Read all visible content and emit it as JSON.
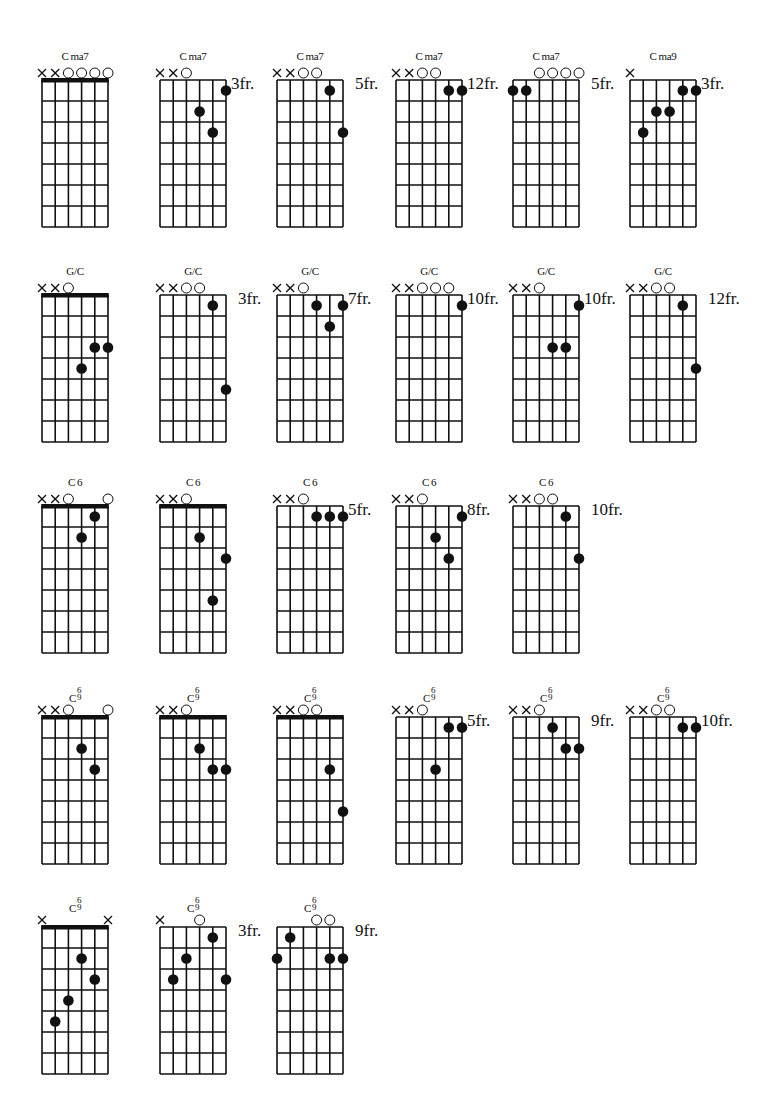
{
  "page": {
    "background": "#ffffff",
    "ink": "#111111",
    "layout": {
      "col_x": [
        42,
        160,
        277,
        396,
        513,
        630
      ],
      "row_grid_top": [
        80,
        295,
        506,
        717,
        927
      ],
      "cell_w": 13.2,
      "cell_h": 21,
      "strings": 6,
      "frets": 7
    }
  },
  "chart_data": {
    "type": "table",
    "notation": {
      "strings": "1 = low E (left) ... 6 = high e (right)",
      "markers": "x = muted, o = open, '' = none",
      "dots": "[string, fret-cell] relative to diagram top",
      "nut": "true when thick top bar (open position)"
    },
    "rows": [
      {
        "name": "Cma7",
        "chords": [
          {
            "title": "Cma7",
            "title_main": "C",
            "title_suffix": "ma7",
            "row": 0,
            "col": 0,
            "nut": true,
            "fret_label": "",
            "markers": [
              "x",
              "x",
              "o",
              "o",
              "o",
              "o"
            ],
            "dots": []
          },
          {
            "title": "Cma7",
            "title_main": "C",
            "title_suffix": "ma7",
            "row": 0,
            "col": 1,
            "nut": false,
            "fret_label": "3fr.",
            "markers": [
              "x",
              "x",
              "o",
              "",
              "",
              ""
            ],
            "dots": [
              [
                6,
                1
              ],
              [
                4,
                2
              ],
              [
                5,
                3
              ]
            ]
          },
          {
            "title": "Cma7",
            "title_main": "C",
            "title_suffix": "ma7",
            "row": 0,
            "col": 2,
            "nut": false,
            "fret_label": "5fr.",
            "markers": [
              "x",
              "x",
              "o",
              "o",
              "",
              ""
            ],
            "dots": [
              [
                5,
                1
              ],
              [
                6,
                3
              ]
            ]
          },
          {
            "title": "Cma7",
            "title_main": "C",
            "title_suffix": "ma7",
            "row": 0,
            "col": 3,
            "nut": false,
            "fret_label": "12fr.",
            "markers": [
              "x",
              "x",
              "o",
              "o",
              "",
              ""
            ],
            "dots": [
              [
                5,
                1
              ],
              [
                6,
                1
              ]
            ]
          },
          {
            "title": "Cma7",
            "title_main": "C",
            "title_suffix": "ma7",
            "row": 0,
            "col": 4,
            "nut": false,
            "fret_label": "5fr.",
            "markers": [
              "",
              "",
              "o",
              "o",
              "o",
              "o"
            ],
            "dots": [
              [
                1,
                1
              ],
              [
                2,
                1
              ]
            ]
          },
          {
            "title": "Cma9",
            "title_main": "C",
            "title_suffix": "ma9",
            "row": 0,
            "col": 5,
            "nut": false,
            "fret_label": "3fr.",
            "markers": [
              "x",
              "",
              "",
              "",
              "",
              ""
            ],
            "dots": [
              [
                5,
                1
              ],
              [
                6,
                1
              ],
              [
                3,
                2
              ],
              [
                4,
                2
              ],
              [
                2,
                3
              ]
            ]
          }
        ]
      },
      {
        "name": "G/C",
        "chords": [
          {
            "title": "G/C",
            "title_main": "G/C",
            "title_suffix": "",
            "row": 1,
            "col": 0,
            "nut": true,
            "fret_label": "",
            "markers": [
              "x",
              "x",
              "o",
              "",
              "",
              ""
            ],
            "dots": [
              [
                5,
                3
              ],
              [
                6,
                3
              ],
              [
                4,
                4
              ]
            ]
          },
          {
            "title": "G/C",
            "title_main": "G/C",
            "title_suffix": "",
            "row": 1,
            "col": 1,
            "nut": false,
            "fret_label": "3fr.",
            "markers": [
              "x",
              "x",
              "o",
              "o",
              "",
              ""
            ],
            "dots": [
              [
                5,
                1
              ],
              [
                6,
                5
              ]
            ]
          },
          {
            "title": "G/C",
            "title_main": "G/C",
            "title_suffix": "",
            "row": 1,
            "col": 2,
            "nut": false,
            "fret_label": "7fr.",
            "markers": [
              "x",
              "x",
              "o",
              "",
              "",
              ""
            ],
            "dots": [
              [
                4,
                1
              ],
              [
                6,
                1
              ],
              [
                5,
                2
              ]
            ]
          },
          {
            "title": "G/C",
            "title_main": "G/C",
            "title_suffix": "",
            "row": 1,
            "col": 3,
            "nut": false,
            "fret_label": "10fr.",
            "markers": [
              "x",
              "x",
              "o",
              "o",
              "o",
              ""
            ],
            "dots": [
              [
                6,
                1
              ]
            ]
          },
          {
            "title": "G/C",
            "title_main": "G/C",
            "title_suffix": "",
            "row": 1,
            "col": 4,
            "nut": false,
            "fret_label": "10fr.",
            "markers": [
              "x",
              "x",
              "o",
              "",
              "",
              ""
            ],
            "dots": [
              [
                6,
                1
              ],
              [
                4,
                3
              ],
              [
                5,
                3
              ]
            ]
          },
          {
            "title": "G/C",
            "title_main": "G/C",
            "title_suffix": "",
            "row": 1,
            "col": 5,
            "nut": false,
            "fret_label": "12fr.",
            "markers": [
              "x",
              "x",
              "o",
              "o",
              "",
              ""
            ],
            "dots": [
              [
                5,
                1
              ],
              [
                6,
                4
              ]
            ]
          }
        ]
      },
      {
        "name": "C6",
        "chords": [
          {
            "title": "C6",
            "title_main": "C",
            "title_suffix": "6",
            "row": 2,
            "col": 0,
            "nut": true,
            "fret_label": "",
            "markers": [
              "x",
              "x",
              "o",
              "",
              "",
              "o"
            ],
            "dots": [
              [
                5,
                1
              ],
              [
                4,
                2
              ]
            ]
          },
          {
            "title": "C6",
            "title_main": "C",
            "title_suffix": "6",
            "row": 2,
            "col": 1,
            "nut": true,
            "fret_label": "",
            "markers": [
              "x",
              "x",
              "o",
              "",
              "",
              ""
            ],
            "dots": [
              [
                4,
                2
              ],
              [
                6,
                3
              ],
              [
                5,
                5
              ]
            ]
          },
          {
            "title": "C6",
            "title_main": "C",
            "title_suffix": "6",
            "row": 2,
            "col": 2,
            "nut": false,
            "fret_label": "5fr.",
            "markers": [
              "x",
              "x",
              "o",
              "",
              "",
              ""
            ],
            "dots": [
              [
                4,
                1
              ],
              [
                5,
                1
              ],
              [
                6,
                1
              ]
            ]
          },
          {
            "title": "C6",
            "title_main": "C",
            "title_suffix": "6",
            "row": 2,
            "col": 3,
            "nut": false,
            "fret_label": "8fr.",
            "markers": [
              "x",
              "x",
              "o",
              "",
              "",
              ""
            ],
            "dots": [
              [
                6,
                1
              ],
              [
                4,
                2
              ],
              [
                5,
                3
              ]
            ]
          },
          {
            "title": "C6",
            "title_main": "C",
            "title_suffix": "6",
            "row": 2,
            "col": 4,
            "nut": false,
            "fret_label": "10fr.",
            "markers": [
              "x",
              "x",
              "o",
              "o",
              "",
              ""
            ],
            "dots": [
              [
                5,
                1
              ],
              [
                6,
                3
              ]
            ]
          }
        ]
      },
      {
        "name": "C6/9",
        "chords": [
          {
            "title": "C6/9",
            "title_main": "C",
            "title_suffix": "6/9",
            "row": 3,
            "col": 0,
            "nut": true,
            "fret_label": "",
            "markers": [
              "x",
              "x",
              "o",
              "",
              "",
              "o"
            ],
            "dots": [
              [
                4,
                2
              ],
              [
                5,
                3
              ]
            ]
          },
          {
            "title": "C6/9",
            "title_main": "C",
            "title_suffix": "6/9",
            "row": 3,
            "col": 1,
            "nut": true,
            "fret_label": "",
            "markers": [
              "x",
              "x",
              "o",
              "",
              "",
              ""
            ],
            "dots": [
              [
                4,
                2
              ],
              [
                5,
                3
              ],
              [
                6,
                3
              ]
            ]
          },
          {
            "title": "C6/9",
            "title_main": "C",
            "title_suffix": "6/9",
            "row": 3,
            "col": 2,
            "nut": true,
            "fret_label": "",
            "markers": [
              "x",
              "x",
              "o",
              "o",
              "",
              ""
            ],
            "dots": [
              [
                5,
                3
              ],
              [
                6,
                5
              ]
            ]
          },
          {
            "title": "C6/9",
            "title_main": "C",
            "title_suffix": "6/9",
            "row": 3,
            "col": 3,
            "nut": false,
            "fret_label": "5fr.",
            "markers": [
              "x",
              "x",
              "o",
              "",
              "",
              ""
            ],
            "dots": [
              [
                5,
                1
              ],
              [
                6,
                1
              ],
              [
                4,
                3
              ]
            ]
          },
          {
            "title": "C6/9",
            "title_main": "C",
            "title_suffix": "6/9",
            "row": 3,
            "col": 4,
            "nut": false,
            "fret_label": "9fr.",
            "markers": [
              "x",
              "x",
              "o",
              "",
              "",
              ""
            ],
            "dots": [
              [
                4,
                1
              ],
              [
                5,
                2
              ],
              [
                6,
                2
              ]
            ]
          },
          {
            "title": "C6/9",
            "title_main": "C",
            "title_suffix": "6/9",
            "row": 3,
            "col": 5,
            "nut": false,
            "fret_label": "10fr.",
            "markers": [
              "x",
              "x",
              "o",
              "o",
              "",
              ""
            ],
            "dots": [
              [
                5,
                1
              ],
              [
                6,
                1
              ]
            ]
          }
        ]
      },
      {
        "name": "C6/9",
        "chords": [
          {
            "title": "C6/9",
            "title_main": "C",
            "title_suffix": "6/9",
            "row": 4,
            "col": 0,
            "nut": true,
            "fret_label": "",
            "markers": [
              "x",
              "",
              "",
              "",
              "",
              "x"
            ],
            "dots": [
              [
                4,
                2
              ],
              [
                5,
                3
              ],
              [
                3,
                4
              ],
              [
                2,
                5
              ]
            ]
          },
          {
            "title": "C6/9",
            "title_main": "C",
            "title_suffix": "6/9",
            "row": 4,
            "col": 1,
            "nut": false,
            "fret_label": "3fr.",
            "markers": [
              "x",
              "",
              "",
              "o",
              "",
              ""
            ],
            "dots": [
              [
                5,
                1
              ],
              [
                3,
                2
              ],
              [
                2,
                3
              ],
              [
                6,
                3
              ]
            ]
          },
          {
            "title": "C6/9",
            "title_main": "C",
            "title_suffix": "6/9",
            "row": 4,
            "col": 2,
            "nut": false,
            "fret_label": "9fr.",
            "markers": [
              "",
              "",
              "",
              "o",
              "o",
              ""
            ],
            "dots": [
              [
                2,
                1
              ],
              [
                1,
                2
              ],
              [
                5,
                2
              ],
              [
                6,
                2
              ]
            ]
          }
        ]
      }
    ]
  }
}
